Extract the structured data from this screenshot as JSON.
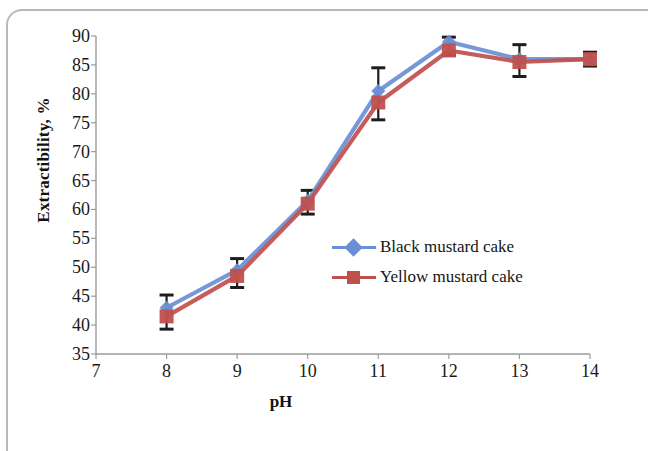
{
  "chart_data": {
    "type": "line",
    "title": "",
    "xlabel": "pH",
    "ylabel": "Extractibility, %",
    "x": [
      8,
      9,
      10,
      11,
      12,
      13,
      14
    ],
    "xlim": [
      7,
      14
    ],
    "ylim": [
      35,
      90
    ],
    "xticks": [
      "7",
      "8",
      "9",
      "10",
      "11",
      "12",
      "13",
      "14"
    ],
    "yticks": [
      "35",
      "40",
      "45",
      "50",
      "55",
      "60",
      "65",
      "70",
      "75",
      "80",
      "85",
      "90"
    ],
    "grid": false,
    "legend_position": "center-right inside plot",
    "series": [
      {
        "name": "Black mustard cake",
        "color": "#6B8FD4",
        "marker": "diamond",
        "values": [
          43.0,
          49.5,
          61.5,
          80.5,
          89.0,
          86.0,
          86.0
        ],
        "errors": [
          2.2,
          2.0,
          1.8,
          4.0,
          0.8,
          2.5,
          1.2
        ]
      },
      {
        "name": "Yellow mustard cake",
        "color": "#C0504D",
        "marker": "square",
        "values": [
          41.5,
          48.5,
          61.0,
          78.5,
          87.5,
          85.5,
          86.0
        ],
        "errors": [
          2.2,
          2.0,
          1.8,
          3.0,
          0.8,
          2.5,
          1.2
        ]
      }
    ]
  },
  "legend": {
    "items": [
      {
        "label": "Black mustard cake"
      },
      {
        "label": "Yellow mustard cake"
      }
    ]
  }
}
